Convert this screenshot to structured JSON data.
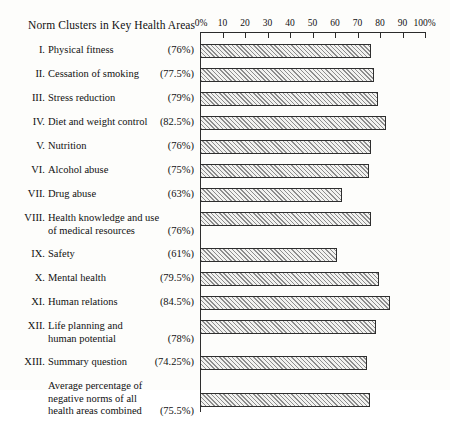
{
  "chart_data": {
    "type": "bar",
    "title": "Norm Clusters in Key Health Areas",
    "orientation": "horizontal",
    "xlabel": "",
    "ylabel": "",
    "xlim": [
      0,
      100
    ],
    "grid": false,
    "legend": null,
    "axis_unit": "%",
    "tick_labels": [
      "0%",
      "10",
      "20",
      "30",
      "40",
      "50",
      "60",
      "70",
      "80",
      "90",
      "100%"
    ],
    "tick_values": [
      0,
      10,
      20,
      30,
      40,
      50,
      60,
      70,
      80,
      90,
      100
    ],
    "categories": [
      "I. Physical fitness",
      "II. Cessation of smoking",
      "III. Stress reduction",
      "IV. Diet and weight control",
      "V. Nutrition",
      "VI. Alcohol abuse",
      "VII. Drug abuse",
      "VIII. Health knowledge and use of medical resources",
      "IX. Safety",
      "X. Mental health",
      "XI. Human relations",
      "XII. Life planning and human potential",
      "XIII. Summary question",
      "Average percentage of negative norms of all health areas combined"
    ],
    "values": [
      76,
      77.5,
      79,
      82.5,
      76,
      75,
      63,
      76,
      61,
      79.5,
      84.5,
      78,
      74.25,
      75.5
    ],
    "value_labels": [
      "(76%)",
      "(77.5%)",
      "(79%)",
      "(82.5%)",
      "(76%)",
      "(75%)",
      "(63%)",
      "(76%)",
      "(61%)",
      "(79.5%)",
      "(84.5%)",
      "(78%)",
      "(74.25%)",
      "(75.5%)"
    ]
  },
  "rows": [
    {
      "numeral": "I.",
      "lines": [
        "Physical fitness"
      ],
      "pct": "(76%)",
      "value": 76,
      "pct_line": 0
    },
    {
      "numeral": "II.",
      "lines": [
        "Cessation of smoking"
      ],
      "pct": "(77.5%)",
      "value": 77.5,
      "pct_line": 0
    },
    {
      "numeral": "III.",
      "lines": [
        "Stress reduction"
      ],
      "pct": "(79%)",
      "value": 79,
      "pct_line": 0
    },
    {
      "numeral": "IV.",
      "lines": [
        "Diet and weight control"
      ],
      "pct": "(82.5%)",
      "value": 82.5,
      "pct_line": 0
    },
    {
      "numeral": "V.",
      "lines": [
        "Nutrition"
      ],
      "pct": "(76%)",
      "value": 76,
      "pct_line": 0
    },
    {
      "numeral": "VI.",
      "lines": [
        "Alcohol abuse"
      ],
      "pct": "(75%)",
      "value": 75,
      "pct_line": 0
    },
    {
      "numeral": "VII.",
      "lines": [
        "Drug abuse"
      ],
      "pct": "(63%)",
      "value": 63,
      "pct_line": 0
    },
    {
      "numeral": "VIII.",
      "lines": [
        "Health knowledge and use",
        "of medical resources"
      ],
      "pct": "(76%)",
      "value": 76,
      "pct_line": 1
    },
    {
      "numeral": "IX.",
      "lines": [
        "Safety"
      ],
      "pct": "(61%)",
      "value": 61,
      "pct_line": 0
    },
    {
      "numeral": "X.",
      "lines": [
        "Mental health"
      ],
      "pct": "(79.5%)",
      "value": 79.5,
      "pct_line": 0
    },
    {
      "numeral": "XI.",
      "lines": [
        "Human relations"
      ],
      "pct": "(84.5%)",
      "value": 84.5,
      "pct_line": 0
    },
    {
      "numeral": "XII.",
      "lines": [
        "Life planning and",
        "human potential"
      ],
      "pct": "(78%)",
      "value": 78,
      "pct_line": 1
    },
    {
      "numeral": "XIII.",
      "lines": [
        "Summary question"
      ],
      "pct": "(74.25%)",
      "value": 74.25,
      "pct_line": 0
    },
    {
      "numeral": "",
      "lines": [
        "Average percentage of",
        "negative norms of all",
        "health areas combined"
      ],
      "pct": "(75.5%)",
      "value": 75.5,
      "pct_line": 2
    }
  ]
}
